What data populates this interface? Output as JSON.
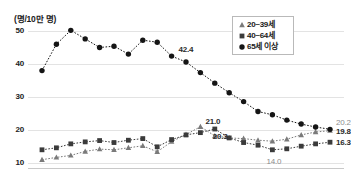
{
  "chart_data": {
    "type": "line",
    "title": "",
    "ylabel": "(명/10만 명)",
    "xlabel": "",
    "ylim": [
      8,
      52
    ],
    "grid": true,
    "legend_position": "top-right",
    "x": [
      1,
      2,
      3,
      4,
      5,
      6,
      7,
      8,
      9,
      10,
      11,
      12,
      13,
      14,
      15,
      16,
      17,
      18,
      19,
      20,
      21
    ],
    "yticks": [
      10,
      20,
      30,
      40,
      50
    ],
    "series": [
      {
        "name": "20~39세",
        "marker": "triangle",
        "color": "#7a7a7a",
        "values": [
          11.0,
          11.7,
          12.3,
          13.5,
          14.2,
          14.0,
          14.6,
          15.2,
          13.4,
          16.5,
          18.6,
          21.0,
          18.2,
          17.6,
          17.4,
          16.9,
          16.6,
          17.2,
          18.5,
          19.4,
          19.8
        ]
      },
      {
        "name": "40~64세",
        "marker": "square",
        "color": "#3b3b3b",
        "values": [
          14.0,
          14.6,
          15.8,
          16.4,
          16.8,
          16.2,
          16.9,
          17.4,
          14.9,
          17.1,
          18.5,
          19.2,
          20.3,
          17.6,
          16.2,
          15.4,
          14.0,
          14.3,
          15.1,
          15.8,
          16.3
        ]
      },
      {
        "name": "65세 이상",
        "marker": "circle",
        "color": "#151515",
        "values": [
          38.0,
          46.0,
          50.2,
          47.6,
          45.0,
          45.4,
          43.0,
          47.2,
          46.6,
          42.4,
          40.6,
          37.4,
          34.2,
          31.3,
          28.6,
          25.6,
          24.6,
          23.0,
          21.8,
          20.9,
          20.2
        ]
      }
    ],
    "data_labels": [
      {
        "text": "42.4",
        "series": "65세 이상",
        "index": 9
      },
      {
        "text": "21.0",
        "series": "20~39세",
        "index": 11
      },
      {
        "text": "20.3",
        "series": "40~64세",
        "index": 12
      },
      {
        "text": "14.0",
        "series": "40~64세",
        "index": 16
      },
      {
        "text": "20.2",
        "series": "65세 이상",
        "index": 20
      },
      {
        "text": "19.8",
        "series": "20~39세",
        "index": 20
      },
      {
        "text": "16.3",
        "series": "40~64세",
        "index": 20
      }
    ]
  },
  "legend": {
    "items": [
      {
        "label": "20~39세",
        "marker": "triangle-marker"
      },
      {
        "label": "40~64세",
        "marker": "square-marker"
      },
      {
        "label": "65세 이상",
        "marker": "circle-marker"
      }
    ]
  },
  "axis": {
    "y_title": "(명/10만 명)",
    "ticks": [
      "50",
      "40",
      "30",
      "20",
      "10"
    ]
  }
}
